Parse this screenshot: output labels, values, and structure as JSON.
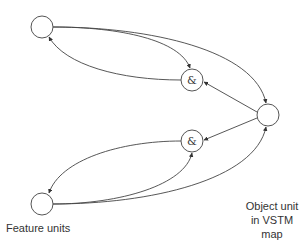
{
  "diagram": {
    "nodes": [
      {
        "id": "feature_top",
        "label": "",
        "role": "feature unit"
      },
      {
        "id": "and_top",
        "label": "&",
        "role": "conjunction unit"
      },
      {
        "id": "object",
        "label": "",
        "role": "object unit"
      },
      {
        "id": "and_bottom",
        "label": "&",
        "role": "conjunction unit"
      },
      {
        "id": "feature_bottom",
        "label": "",
        "role": "feature unit"
      }
    ],
    "edges": [
      {
        "from": "feature_top",
        "to": "and_top"
      },
      {
        "from": "feature_top",
        "to": "object"
      },
      {
        "from": "and_top",
        "to": "feature_top"
      },
      {
        "from": "object",
        "to": "and_top"
      },
      {
        "from": "object",
        "to": "and_bottom"
      },
      {
        "from": "and_bottom",
        "to": "feature_bottom"
      },
      {
        "from": "feature_bottom",
        "to": "and_bottom"
      },
      {
        "from": "feature_bottom",
        "to": "object"
      }
    ],
    "captions": {
      "feature_units": "Feature units",
      "object_unit_line1": "Object unit",
      "object_unit_line2": "in VSTM map"
    }
  },
  "colors": {
    "stroke": "#444444",
    "text": "#333333",
    "background": "#ffffff"
  }
}
